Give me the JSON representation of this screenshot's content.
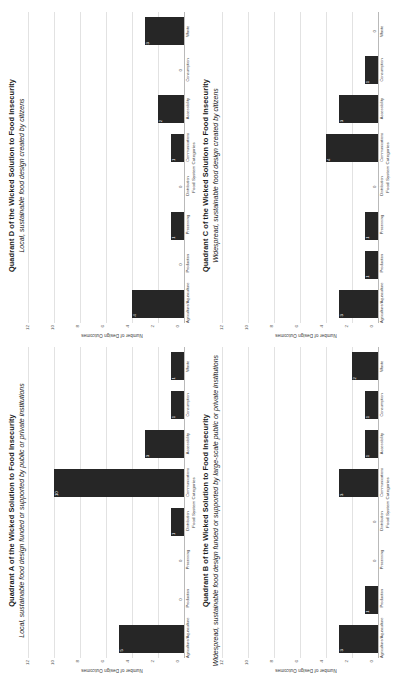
{
  "figure": {
    "orientation": "rotated-90-ccw",
    "panel_order": [
      "A",
      "D",
      "B",
      "C"
    ],
    "bar_color": "#262626",
    "gridline_color": "#e2e2e2",
    "axis_color": "#b9b9b9"
  },
  "axis": {
    "ylabel": "Number of Design Outcomes",
    "xlabel": "Food System Categories",
    "yticks": [
      "12",
      "10",
      "8",
      "6",
      "4",
      "2",
      "0"
    ],
    "ylim": [
      0,
      12
    ],
    "categories": [
      "Agriculture/Aquaculture",
      "Production",
      "Processing",
      "Distribution",
      "Communications",
      "Accessibility",
      "Consumption",
      "Waste"
    ]
  },
  "chart_data": [
    {
      "id": "A",
      "type": "bar",
      "title": "Quadrant A of the Wicked Solution to Food Insecurity",
      "subtitle": "Local, sustainable food design funded or supported by public or private institutions",
      "xlabel": "Food System Categories",
      "ylabel": "Number of Design Outcomes",
      "ylim": [
        0,
        12
      ],
      "grid": true,
      "legend": "none",
      "categories": [
        "Agriculture/Aquaculture",
        "Production",
        "Processing",
        "Distribution",
        "Communications",
        "Accessibility",
        "Consumption",
        "Waste"
      ],
      "values": [
        5,
        0,
        0,
        1,
        10,
        3,
        1,
        1
      ]
    },
    {
      "id": "D",
      "type": "bar",
      "title": "Quadrant D of the Wicked Solution to Food Insecurity",
      "subtitle": "Local, sustainable food design created by citizens",
      "xlabel": "Food System Categories",
      "ylabel": "Number of Design Outcomes",
      "ylim": [
        0,
        12
      ],
      "grid": true,
      "legend": "none",
      "categories": [
        "Agriculture/Aquaculture",
        "Production",
        "Processing",
        "Distribution",
        "Communications",
        "Accessibility",
        "Consumption",
        "Waste"
      ],
      "values": [
        4,
        0,
        1,
        0,
        1,
        2,
        0,
        3
      ]
    },
    {
      "id": "B",
      "type": "bar",
      "title": "Quadrant B of the Wicked Solution to Food Insecurity",
      "subtitle": "Widespread, sustainable food design funded or supported by large-scale public or private institutions",
      "xlabel": "Food System Categories",
      "ylabel": "Number of Design Outcomes",
      "ylim": [
        0,
        12
      ],
      "grid": true,
      "legend": "none",
      "categories": [
        "Agriculture/Aquaculture",
        "Production",
        "Processing",
        "Distribution",
        "Communications",
        "Accessibility",
        "Consumption",
        "Waste"
      ],
      "values": [
        3,
        1,
        0,
        0,
        3,
        1,
        1,
        2
      ]
    },
    {
      "id": "C",
      "type": "bar",
      "title": "Quadrant C of the Wicked Solution to Food Insecurity",
      "subtitle": "Widespread, sustainable food design created by citizens",
      "xlabel": "Food System Categories",
      "ylabel": "Number of Design Outcomes",
      "ylim": [
        0,
        12
      ],
      "grid": true,
      "legend": "none",
      "categories": [
        "Agriculture/Aquaculture",
        "Production",
        "Processing",
        "Distribution",
        "Communications",
        "Accessibility",
        "Consumption",
        "Waste"
      ],
      "values": [
        3,
        1,
        1,
        0,
        4,
        3,
        1,
        0
      ]
    }
  ]
}
